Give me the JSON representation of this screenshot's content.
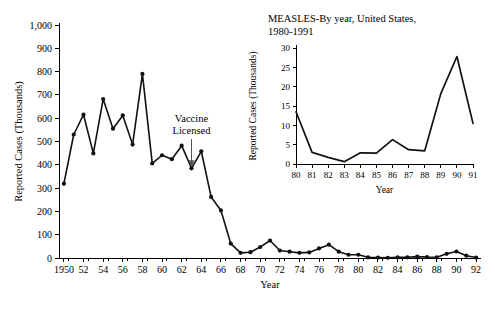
{
  "chart_data": [
    {
      "id": "main",
      "type": "line",
      "title": "",
      "xlabel": "Year",
      "ylabel": "Reported Cases (Thousands)",
      "xlim": [
        1949.5,
        1992.5
      ],
      "ylim": [
        0,
        1000
      ],
      "yticks": [
        0,
        100,
        200,
        300,
        400,
        500,
        600,
        700,
        800,
        900,
        1000
      ],
      "yticklabels": [
        "0",
        "100",
        "200",
        "300",
        "400",
        "500",
        "600",
        "700",
        "800",
        "900",
        "1,000"
      ],
      "xticks": [
        1950,
        1952,
        1954,
        1956,
        1958,
        1960,
        1962,
        1964,
        1966,
        1968,
        1970,
        1972,
        1974,
        1976,
        1978,
        1980,
        1982,
        1984,
        1986,
        1988,
        1990,
        1992
      ],
      "xticklabels": [
        "1950",
        "52",
        "54",
        "56",
        "58",
        "60",
        "62",
        "64",
        "66",
        "68",
        "70",
        "72",
        "74",
        "76",
        "78",
        "80",
        "82",
        "84",
        "86",
        "88",
        "90",
        "92"
      ],
      "grid": false,
      "legend": "none",
      "markers": true,
      "x": [
        1950,
        1951,
        1952,
        1953,
        1954,
        1955,
        1956,
        1957,
        1958,
        1959,
        1960,
        1961,
        1962,
        1963,
        1964,
        1965,
        1966,
        1967,
        1968,
        1969,
        1970,
        1971,
        1972,
        1973,
        1974,
        1975,
        1976,
        1977,
        1978,
        1979,
        1980,
        1981,
        1982,
        1983,
        1984,
        1985,
        1986,
        1987,
        1988,
        1989,
        1990,
        1991,
        1992
      ],
      "values": [
        319,
        530,
        615,
        449,
        682,
        555,
        612,
        487,
        790,
        406,
        441,
        424,
        482,
        385,
        458,
        262,
        204,
        62,
        22,
        25,
        47,
        75,
        32,
        27,
        22,
        24,
        41,
        57,
        27,
        14,
        14,
        3,
        2,
        1,
        3,
        3,
        6,
        4,
        3,
        18,
        28,
        10,
        2
      ]
    },
    {
      "id": "inset",
      "type": "line",
      "title": "MEASLES-By year, United States, 1980-1991",
      "title_lines": [
        "MEASLES-By year, United States,",
        "1980-1991"
      ],
      "xlabel": "Year",
      "ylabel": "Reported Cases (Thousands)",
      "xlim": [
        1980,
        1991
      ],
      "ylim": [
        0,
        30
      ],
      "yticks": [
        0,
        5,
        10,
        15,
        20,
        25,
        30
      ],
      "yticklabels": [
        "0",
        "5",
        "10",
        "15",
        "20",
        "25",
        "30"
      ],
      "xticks": [
        1980,
        1981,
        1982,
        1983,
        1984,
        1985,
        1986,
        1987,
        1988,
        1989,
        1990,
        1991
      ],
      "xticklabels": [
        "80",
        "81",
        "82",
        "83",
        "84",
        "85",
        "86",
        "87",
        "88",
        "89",
        "90",
        "91"
      ],
      "grid": false,
      "legend": "none",
      "markers": false,
      "x": [
        1980,
        1981,
        1982,
        1983,
        1984,
        1985,
        1986,
        1987,
        1988,
        1989,
        1990,
        1991
      ],
      "values": [
        13.5,
        3.0,
        1.7,
        0.6,
        2.9,
        2.8,
        6.3,
        3.7,
        3.4,
        18.2,
        27.8,
        10.5
      ]
    }
  ],
  "annotations": {
    "vaccine": {
      "label_lines": [
        "Vaccine",
        "Licensed"
      ],
      "year": 1963,
      "value": 385
    }
  },
  "colors": {
    "line": "#111111",
    "axis": "#000000",
    "text": "#000000",
    "arrow": "#555555",
    "background": "#ffffff"
  }
}
